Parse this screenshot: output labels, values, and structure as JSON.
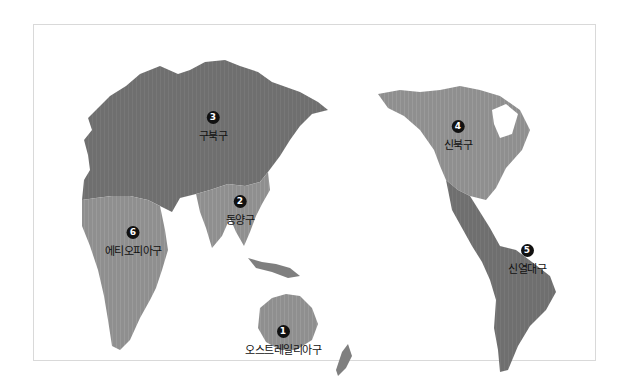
{
  "map": {
    "title": "동물 지리구 세계 지도",
    "colors": {
      "dark_region": "#6f6f6f",
      "light_region": "#8f8f8f",
      "frame_border": "#d9d9d9",
      "background": "#ffffff",
      "marker_fill": "#111111"
    },
    "regions": [
      {
        "number": "1",
        "label": "오스트레일리아구",
        "x": 283,
        "y": 319
      },
      {
        "number": "2",
        "label": "동양구",
        "x": 240,
        "y": 189
      },
      {
        "number": "3",
        "label": "구북구",
        "x": 213,
        "y": 105
      },
      {
        "number": "4",
        "label": "신북구",
        "x": 458,
        "y": 114
      },
      {
        "number": "5",
        "label": "신열대구",
        "x": 527,
        "y": 238
      },
      {
        "number": "6",
        "label": "에티오피아구",
        "x": 133,
        "y": 220
      }
    ]
  }
}
